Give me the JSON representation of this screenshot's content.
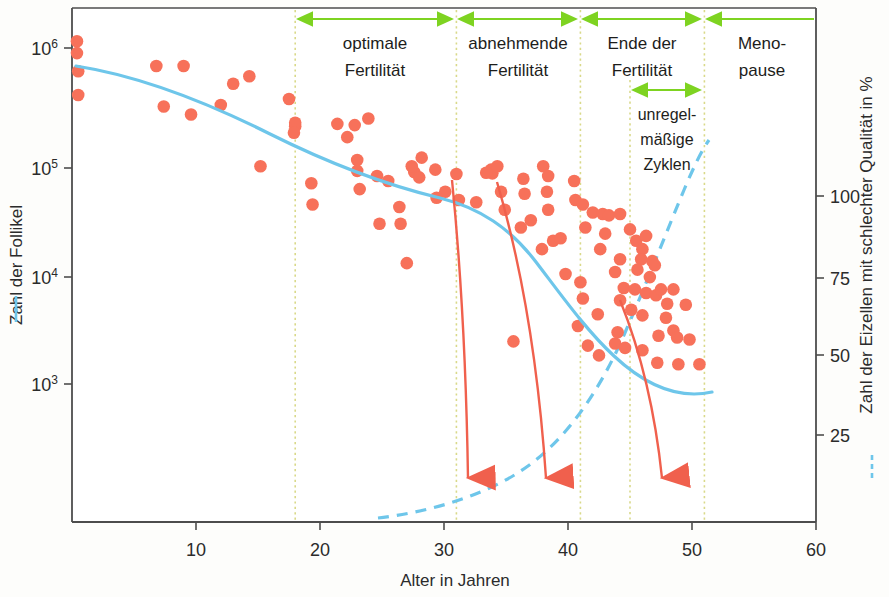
{
  "chart_data": {
    "type": "scatter",
    "title": "",
    "xlabel": "Alter in Jahren",
    "ylabel_left": "Zahl der Follikel",
    "ylabel_right": "Zahl der Eizellen mit schlechter Qualität in %",
    "xlim": [
      0,
      60
    ],
    "xticks": [
      10,
      20,
      30,
      40,
      50,
      60
    ],
    "xtick_labels": [
      "10",
      "20",
      "30",
      "40",
      "50",
      "60"
    ],
    "ylim_left_log": [
      2.35,
      6.25
    ],
    "yticks_left": [
      1000,
      10000,
      100000,
      1000000
    ],
    "ytick_labels_left": [
      "10³",
      "10⁴",
      "10⁵",
      "10⁶"
    ],
    "ytick_bases_left": [
      "10",
      "10",
      "10",
      "10"
    ],
    "ytick_exps_left": [
      "3",
      "4",
      "5",
      "6"
    ],
    "ylim_right": [
      0,
      130
    ],
    "yticks_right": [
      25,
      50,
      75,
      100
    ],
    "ytick_labels_right": [
      "25",
      "50",
      "75",
      "100"
    ],
    "grid": false,
    "legend_position": "axis-labels",
    "series": [
      {
        "name": "Zahl der Follikel",
        "type": "scatter",
        "color": "#f7715a",
        "points": [
          [
            0.4,
            1150000
          ],
          [
            0.4,
            900000
          ],
          [
            0.5,
            620000
          ],
          [
            0.5,
            380000
          ],
          [
            6.8,
            690000
          ],
          [
            9.0,
            690000
          ],
          [
            7.4,
            300000
          ],
          [
            9.6,
            255000
          ],
          [
            13.0,
            480000
          ],
          [
            14.3,
            560000
          ],
          [
            12.0,
            310000
          ],
          [
            15.2,
            88000
          ],
          [
            17.5,
            350000
          ],
          [
            18.0,
            200000
          ],
          [
            18.0,
            215000
          ],
          [
            17.9,
            175000
          ],
          [
            19.3,
            62000
          ],
          [
            19.4,
            40000
          ],
          [
            21.4,
            210000
          ],
          [
            22.8,
            205000
          ],
          [
            23.9,
            235000
          ],
          [
            22.2,
            160000
          ],
          [
            23.0,
            100000
          ],
          [
            23.0,
            80000
          ],
          [
            23.2,
            55000
          ],
          [
            24.6,
            72000
          ],
          [
            25.5,
            65000
          ],
          [
            26.4,
            38000
          ],
          [
            24.8,
            27000
          ],
          [
            26.5,
            27000
          ],
          [
            27.6,
            78000
          ],
          [
            28.0,
            70000
          ],
          [
            28.2,
            105000
          ],
          [
            27.4,
            88000
          ],
          [
            29.3,
            82000
          ],
          [
            27.0,
            12000
          ],
          [
            29.4,
            46000
          ],
          [
            31.0,
            75000
          ],
          [
            30.1,
            52000
          ],
          [
            31.2,
            44000
          ],
          [
            32.6,
            42000
          ],
          [
            33.8,
            82000
          ],
          [
            33.9,
            76000
          ],
          [
            33.4,
            77000
          ],
          [
            34.3,
            88000
          ],
          [
            34.6,
            52000
          ],
          [
            34.9,
            36000
          ],
          [
            36.4,
            68000
          ],
          [
            36.5,
            50000
          ],
          [
            37.0,
            29000
          ],
          [
            38.0,
            88000
          ],
          [
            38.4,
            72000
          ],
          [
            38.3,
            52000
          ],
          [
            38.4,
            36000
          ],
          [
            36.2,
            25000
          ],
          [
            38.8,
            19000
          ],
          [
            39.4,
            20000
          ],
          [
            37.9,
            16000
          ],
          [
            40.5,
            65000
          ],
          [
            40.6,
            44000
          ],
          [
            41.2,
            40000
          ],
          [
            41.4,
            25000
          ],
          [
            42.0,
            34000
          ],
          [
            42.8,
            33000
          ],
          [
            43.3,
            32000
          ],
          [
            44.2,
            33000
          ],
          [
            43.0,
            22000
          ],
          [
            42.6,
            16000
          ],
          [
            43.8,
            10000
          ],
          [
            44.2,
            13000
          ],
          [
            44.5,
            7200
          ],
          [
            44.2,
            5600
          ],
          [
            45.0,
            24000
          ],
          [
            45.5,
            19000
          ],
          [
            46.0,
            16000
          ],
          [
            46.3,
            21000
          ],
          [
            45.9,
            13000
          ],
          [
            46.8,
            12500
          ],
          [
            45.6,
            10500
          ],
          [
            46.6,
            9000
          ],
          [
            47.0,
            11500
          ],
          [
            45.4,
            7000
          ],
          [
            46.3,
            6500
          ],
          [
            47.1,
            6200
          ],
          [
            45.1,
            4600
          ],
          [
            46.0,
            4100
          ],
          [
            47.5,
            7000
          ],
          [
            48.5,
            7000
          ],
          [
            48.0,
            5200
          ],
          [
            49.5,
            5100
          ],
          [
            47.9,
            3900
          ],
          [
            48.5,
            3000
          ],
          [
            47.3,
            2700
          ],
          [
            48.8,
            2600
          ],
          [
            49.8,
            2500
          ],
          [
            39.8,
            9600
          ],
          [
            41.0,
            8100
          ],
          [
            41.2,
            5800
          ],
          [
            42.4,
            4200
          ],
          [
            40.8,
            3300
          ],
          [
            43.8,
            2300
          ],
          [
            44.6,
            2100
          ],
          [
            42.5,
            1800
          ],
          [
            47.2,
            1550
          ],
          [
            48.9,
            1500
          ],
          [
            50.6,
            1500
          ],
          [
            46.0,
            2000
          ],
          [
            44.0,
            2900
          ],
          [
            35.6,
            2400
          ],
          [
            41.6,
            2200
          ]
        ]
      },
      {
        "name": "Follikelzahl-Trendkurve",
        "type": "line",
        "style": "solid",
        "color": "#6ec6ea",
        "axis": "left",
        "description": "Abfallende Trendkurve der Follikelzahl von ca. 6,4·10⁵ bei Geburt auf ca. 1·10³ um 51 Jahre"
      },
      {
        "name": "Eizellen schlechter Qualität",
        "type": "line",
        "style": "dashed",
        "color": "#6ec6ea",
        "axis": "right",
        "description": "Ansteigende gestrichelte Kurve von ca. 0 % bei 25 Jahren auf über 100 % um 51 Jahre"
      },
      {
        "name": "Abnahmepfeile",
        "type": "annotation-arrows",
        "color": "#f0604d",
        "count": 3,
        "description": "Drei nach unten gekrümmte rote Pfeile ab ca. 31, 33 und 44 Jahren"
      }
    ]
  },
  "phases": {
    "arrow_color": "#7ed321",
    "divider_color": "#d9d98a",
    "bands": [
      {
        "id": "optimale-fertilitaet",
        "line1": "optimale",
        "line2": "Fertilität",
        "start_age": 18,
        "end_age": 31
      },
      {
        "id": "abnehmende-fertilitaet",
        "line1": "abnehmende",
        "line2": "Fertilität",
        "start_age": 31,
        "end_age": 41
      },
      {
        "id": "ende-der-fertilitaet",
        "line1": "Ende der",
        "line2": "Fertilität",
        "start_age": 41,
        "end_age": 51
      },
      {
        "id": "menopause",
        "line1": "Meno-",
        "line2": "pause",
        "start_age": 51,
        "end_age": 60
      }
    ],
    "sub_band": {
      "id": "unregelmaessige-zyklen",
      "line1": "unregel-",
      "line2": "mäßige",
      "line3": "Zyklen",
      "start_age": 45,
      "end_age": 51
    }
  },
  "legend": {
    "left": {
      "label": "Zahl der Follikel",
      "style": "solid",
      "color": "#6ec6ea"
    },
    "right": {
      "label": "Zahl der Eizellen mit schlechter Qualität in %",
      "style": "dashed",
      "color": "#6ec6ea"
    }
  },
  "colors": {
    "dot": "#f7715a",
    "blue": "#6ec6ea",
    "arrow_red": "#f0604d",
    "green": "#7ed321",
    "divider": "#d9d98a",
    "axis": "#4d4d4d",
    "text": "#1d1d1b"
  }
}
